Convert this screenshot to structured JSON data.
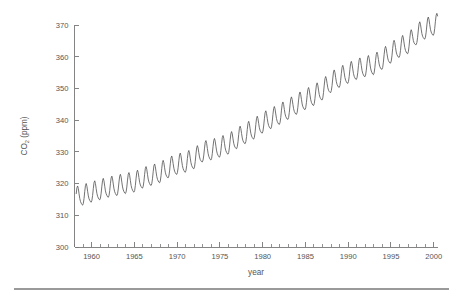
{
  "chart_data": {
    "type": "line",
    "title": "",
    "subtitle": "",
    "xlabel": "year",
    "ylabel": "CO2 (ppm)",
    "ylabel_parts": {
      "prefix": "CO",
      "subscript": "2",
      "suffix": " (ppm)"
    },
    "xlim": [
      1958,
      2000.5
    ],
    "ylim": [
      300,
      370
    ],
    "grid": false,
    "legend": null,
    "legend_position": "none",
    "x_major_ticks": [
      1960,
      1965,
      1970,
      1975,
      1980,
      1985,
      1990,
      1995,
      2000
    ],
    "x_major_tick_labels": [
      "1960",
      "1965",
      "1970",
      "1975",
      "1980",
      "1985",
      "1990",
      "1995",
      "2000"
    ],
    "x_minor_tick_step": 1,
    "y_major_ticks": [
      300,
      310,
      320,
      330,
      340,
      350,
      360,
      370
    ],
    "y_major_tick_labels": [
      "300",
      "310",
      "320",
      "330",
      "340",
      "350",
      "360",
      "370"
    ],
    "series": [
      {
        "name": "Mauna Loa monthly mean CO2",
        "color": "#5a5a5a",
        "x_start": 1958.2,
        "x_step": 0.08333333,
        "annual_means": [
          {
            "year": 1958,
            "value": 315.3
          },
          {
            "year": 1959,
            "value": 315.98
          },
          {
            "year": 1960,
            "value": 316.91
          },
          {
            "year": 1961,
            "value": 317.64
          },
          {
            "year": 1962,
            "value": 318.45
          },
          {
            "year": 1963,
            "value": 318.99
          },
          {
            "year": 1964,
            "value": 319.62
          },
          {
            "year": 1965,
            "value": 320.04
          },
          {
            "year": 1966,
            "value": 321.38
          },
          {
            "year": 1967,
            "value": 322.16
          },
          {
            "year": 1968,
            "value": 323.04
          },
          {
            "year": 1969,
            "value": 324.62
          },
          {
            "year": 1970,
            "value": 325.68
          },
          {
            "year": 1971,
            "value": 326.32
          },
          {
            "year": 1972,
            "value": 327.45
          },
          {
            "year": 1973,
            "value": 329.68
          },
          {
            "year": 1974,
            "value": 330.18
          },
          {
            "year": 1975,
            "value": 331.11
          },
          {
            "year": 1976,
            "value": 332.04
          },
          {
            "year": 1977,
            "value": 333.83
          },
          {
            "year": 1978,
            "value": 335.4
          },
          {
            "year": 1979,
            "value": 336.84
          },
          {
            "year": 1980,
            "value": 338.75
          },
          {
            "year": 1981,
            "value": 340.11
          },
          {
            "year": 1982,
            "value": 341.45
          },
          {
            "year": 1983,
            "value": 343.05
          },
          {
            "year": 1984,
            "value": 344.65
          },
          {
            "year": 1985,
            "value": 346.12
          },
          {
            "year": 1986,
            "value": 347.42
          },
          {
            "year": 1987,
            "value": 349.19
          },
          {
            "year": 1988,
            "value": 351.57
          },
          {
            "year": 1989,
            "value": 353.12
          },
          {
            "year": 1990,
            "value": 354.39
          },
          {
            "year": 1991,
            "value": 355.61
          },
          {
            "year": 1992,
            "value": 356.45
          },
          {
            "year": 1993,
            "value": 357.1
          },
          {
            "year": 1994,
            "value": 358.83
          },
          {
            "year": 1995,
            "value": 360.82
          },
          {
            "year": 1996,
            "value": 362.61
          },
          {
            "year": 1997,
            "value": 363.73
          },
          {
            "year": 1998,
            "value": 366.7
          },
          {
            "year": 1999,
            "value": 368.38
          },
          {
            "year": 2000,
            "value": 369.55
          }
        ],
        "seasonal_amplitude_ppm": 6.2,
        "seasonal_peak_month": 5,
        "seasonal_trough_month": 10,
        "value_at_start_ppm": 315.7,
        "value_at_end_ppm": 369.4,
        "min_ppm": 312.7,
        "max_ppm": 371.2
      }
    ]
  }
}
